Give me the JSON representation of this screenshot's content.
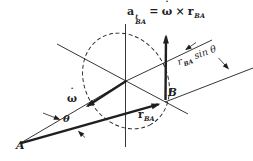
{
  "diagram": {
    "background_color": "#ffffff",
    "ink_color": "#1f1f1f",
    "equation": {
      "accel_symbol": "a",
      "accel_sup": "t",
      "accel_sub": "BA",
      "equals_sign": "=",
      "omega_symbol": "ω",
      "omega_dot": "˙",
      "cross_symbol": "×",
      "r_symbol": "r",
      "r_sub": "BA"
    },
    "omega_label": {
      "symbol": "ω",
      "dot": "˙"
    },
    "theta_label": "θ",
    "point_a": "A",
    "point_b": "B",
    "r_ba_label": {
      "symbol": "r",
      "sub": "BA"
    },
    "offset_label": {
      "symbol": "r",
      "sub": "BA",
      "suffix": "sin θ"
    }
  }
}
